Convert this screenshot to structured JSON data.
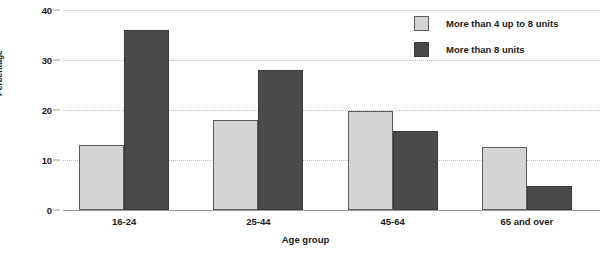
{
  "chart_data": {
    "type": "bar",
    "title": "",
    "xlabel": "Age group",
    "ylabel": "Percentage",
    "categories": [
      "16-24",
      "25-44",
      "45-64",
      "65 and over"
    ],
    "series": [
      {
        "name": "More than 4 up to 8 units",
        "color": "#d4d4d4",
        "values": [
          13.0,
          18.0,
          19.8,
          12.7
        ]
      },
      {
        "name": "More than 8 units",
        "color": "#4a4a4a",
        "values": [
          36.0,
          28.0,
          15.9,
          4.8
        ]
      }
    ],
    "ylim": [
      0,
      40
    ],
    "yticks": [
      0,
      10,
      20,
      30,
      40
    ],
    "grid": true,
    "legend_position": "top-right"
  },
  "axes": {
    "y_title": "Percentage",
    "x_title": "Age group"
  },
  "legend": {
    "items": [
      {
        "label": "More than 4 up to 8 units",
        "swatch": "light"
      },
      {
        "label": "More than 8 units",
        "swatch": "dark"
      }
    ]
  }
}
